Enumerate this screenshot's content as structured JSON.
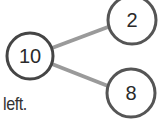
{
  "diagram": {
    "type": "number-bond",
    "whole": {
      "value": "10"
    },
    "parts": [
      {
        "value": "2"
      },
      {
        "value": "8"
      }
    ],
    "caption": "left."
  },
  "colors": {
    "circle_stroke": "#454545",
    "connector": "#9a9a9a",
    "text": "#2a2a2a"
  }
}
